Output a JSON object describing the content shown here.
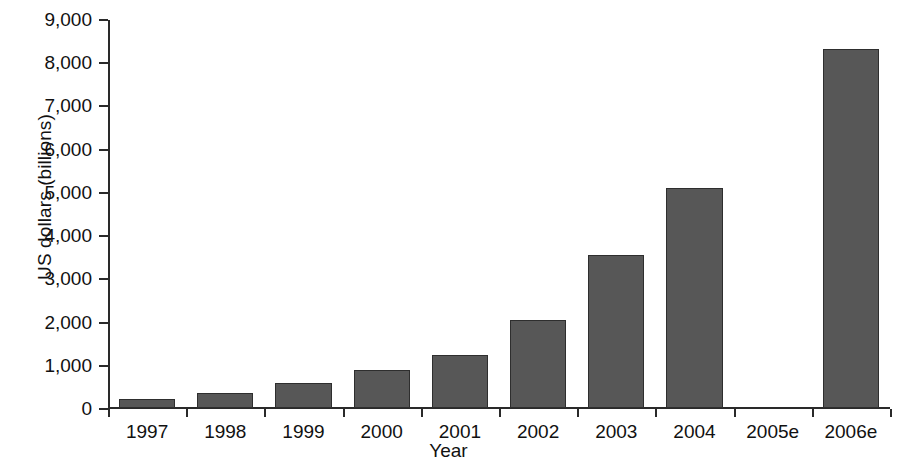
{
  "chart_data": {
    "type": "bar",
    "title": "",
    "xlabel": "Year",
    "ylabel": "US dollars (billions)",
    "categories": [
      "1997",
      "1998",
      "1999",
      "2000",
      "2001",
      "2002",
      "2003",
      "2004",
      "2005e",
      "2006e"
    ],
    "values": [
      200,
      350,
      570,
      890,
      1220,
      2030,
      3550,
      5100,
      null,
      8300
    ],
    "ylim": [
      0,
      9000
    ],
    "ytick_values": [
      0,
      1000,
      2000,
      3000,
      4000,
      5000,
      6000,
      7000,
      8000,
      9000
    ],
    "ytick_labels": [
      "0",
      "1,000",
      "2,000",
      "3,000",
      "4,000",
      "5,000",
      "6,000",
      "7,000",
      "8,000",
      "9,000"
    ],
    "grid": false,
    "legend": null,
    "bar_color": "#575757",
    "bar_border_color": "#2e2e2e",
    "axis_color": "#2a2a2a"
  }
}
